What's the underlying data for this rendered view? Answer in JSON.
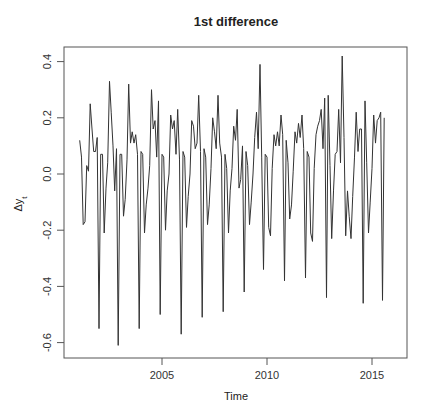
{
  "chart_data": {
    "type": "line",
    "title": "1st difference",
    "xlabel": "Time",
    "ylabel": "Δy_t",
    "ylabel_main": "Δy",
    "ylabel_sub": "t",
    "xlim": [
      2000.7,
      2016.6
    ],
    "ylim": [
      -0.64,
      0.46
    ],
    "x_ticks": [
      2005,
      2010,
      2015
    ],
    "x_tick_labels": [
      "2005",
      "2010",
      "2015"
    ],
    "y_ticks": [
      0.4,
      0.2,
      0.0,
      -0.2,
      -0.4,
      -0.6
    ],
    "y_tick_labels": [
      "0.4",
      "0.2",
      "0.0",
      "-0.2",
      "-0.4",
      "-0.6"
    ],
    "grid": false,
    "x_start": 2001.083,
    "x_step": 0.08333,
    "series": [
      {
        "name": "Δy_t",
        "color": "#333333",
        "values": [
          0.12,
          0.06,
          -0.18,
          -0.17,
          0.03,
          0.01,
          0.25,
          0.16,
          0.08,
          0.08,
          0.13,
          -0.55,
          0.07,
          0.07,
          -0.21,
          -0.05,
          0.04,
          0.33,
          0.22,
          0.1,
          -0.06,
          0.09,
          -0.61,
          0.07,
          0.07,
          -0.15,
          -0.09,
          0.05,
          0.32,
          0.11,
          0.15,
          0.11,
          0.14,
          0.07,
          -0.55,
          0.08,
          0.07,
          -0.21,
          -0.11,
          -0.05,
          0.03,
          0.3,
          0.16,
          0.19,
          0.06,
          0.26,
          -0.5,
          0.07,
          0.06,
          -0.2,
          -0.06,
          0.0,
          0.21,
          0.16,
          0.19,
          0.07,
          0.23,
          0.05,
          -0.57,
          0.08,
          0.06,
          -0.19,
          -0.08,
          0.0,
          0.19,
          0.17,
          0.09,
          0.11,
          0.28,
          0.08,
          -0.51,
          0.09,
          0.06,
          -0.18,
          -0.11,
          0.02,
          0.2,
          0.15,
          0.09,
          0.28,
          0.11,
          0.06,
          -0.49,
          0.07,
          0.02,
          -0.21,
          -0.06,
          0.02,
          0.17,
          0.12,
          0.23,
          -0.05,
          -0.02,
          0.1,
          -0.42,
          0.08,
          0.03,
          -0.18,
          -0.1,
          0.0,
          0.13,
          0.22,
          0.09,
          0.39,
          0.06,
          -0.34,
          0.07,
          0.06,
          -0.19,
          -0.22,
          0.02,
          0.14,
          0.1,
          0.15,
          0.1,
          0.21,
          0.14,
          -0.38,
          0.12,
          0.04,
          -0.16,
          -0.11,
          0.01,
          0.15,
          0.11,
          0.18,
          0.13,
          0.21,
          0.09,
          -0.37,
          0.08,
          0.06,
          -0.21,
          -0.24,
          0.02,
          0.14,
          0.17,
          0.19,
          0.23,
          0.09,
          0.27,
          -0.44,
          0.28,
          0.03,
          -0.23,
          -0.06,
          0.07,
          0.08,
          0.23,
          0.04,
          0.42,
          0.13,
          -0.22,
          -0.06,
          -0.15,
          -0.23,
          -0.08,
          0.06,
          0.22,
          0.08,
          0.16,
          0.16,
          -0.46,
          0.26,
          0.04,
          -0.21,
          -0.1,
          0.02,
          0.21,
          0.11,
          0.19,
          0.2,
          0.22,
          -0.45,
          0.2
        ]
      }
    ]
  }
}
